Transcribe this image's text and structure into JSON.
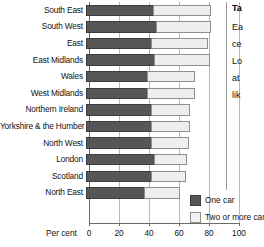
{
  "chart_data": {
    "type": "bar",
    "orientation": "horizontal",
    "stacked": true,
    "title": "",
    "xlabel": "Per cent",
    "ylabel": "",
    "xlim": [
      0,
      100
    ],
    "xticks": [
      0,
      20,
      40,
      60,
      80,
      100
    ],
    "grid": true,
    "legend_position": "bottom-right",
    "categories": [
      "South East",
      "South West",
      "East",
      "East Midlands",
      "Wales",
      "West Midlands",
      "Northern Ireland",
      "Yorkshire & the Humber",
      "North West",
      "London",
      "Scotland",
      "North East"
    ],
    "series": [
      {
        "name": "One car",
        "color": "#565656",
        "values": [
          45,
          47,
          44,
          46,
          41,
          41,
          44,
          44,
          44,
          46,
          44,
          39
        ]
      },
      {
        "name": "Two or more cars",
        "color": "#eeeeee",
        "values": [
          39,
          37,
          38,
          37,
          32,
          32,
          26,
          26,
          25,
          22,
          23,
          24
        ]
      }
    ],
    "totals": [
      84,
      84,
      82,
      83,
      73,
      73,
      70,
      70,
      69,
      68,
      67,
      63
    ]
  },
  "axis": {
    "xlabel": "Per cent",
    "ticks": [
      "0",
      "20",
      "40",
      "60",
      "80",
      "100"
    ]
  },
  "legend": {
    "items": [
      {
        "label": "One car",
        "color": "#565656"
      },
      {
        "label": "Two or more cars",
        "color": "#eeeeee"
      }
    ]
  },
  "sidecol": {
    "title": "Ta",
    "lines": [
      "Ea",
      "ce",
      "Lo",
      "at",
      "lik"
    ]
  }
}
